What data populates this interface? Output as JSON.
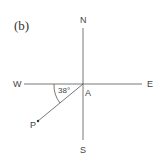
{
  "figure": {
    "label": "(b)",
    "compass": {
      "north": "N",
      "south": "S",
      "east": "E",
      "west": "W"
    },
    "origin_point": "A",
    "bearing_point": "P",
    "angle_label": "38°",
    "angle_degrees": 38,
    "angle_reference": "west, measured toward south",
    "colors": {
      "line": "#555555",
      "text": "#444444",
      "background": "#ffffff"
    }
  }
}
